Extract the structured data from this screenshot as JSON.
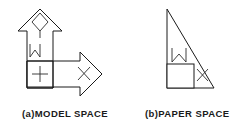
{
  "image": {
    "width": 241,
    "height": 128,
    "background_color": "#ffffff",
    "line_color": "#1a1a1a",
    "kind": "line-art-diagram"
  },
  "figures": [
    {
      "id": "model-space",
      "caption": "(a)MODEL SPACE",
      "description": "Composite arrow outline: an arrow pointing up joined with an arrow pointing right, sharing a square corner region.",
      "glyphs": [
        {
          "name": "diamond",
          "symbol": "diamond",
          "location": "inside up-arrow head"
        },
        {
          "name": "zigzag",
          "symbol": "W",
          "location": "inside up-arrow shaft"
        },
        {
          "name": "plus",
          "symbol": "+",
          "location": "lower-left square cell"
        },
        {
          "name": "cross",
          "symbol": "x",
          "location": "inside right-arrow head"
        }
      ]
    },
    {
      "id": "paper-space",
      "caption": "(b)PAPER SPACE",
      "description": "Right triangle with vertical left leg and horizontal bottom leg, hypotenuse from top-left to bottom-right.",
      "glyphs": [
        {
          "name": "zigzag",
          "symbol": "W",
          "location": "above the square"
        },
        {
          "name": "square",
          "symbol": "square",
          "location": "bottom-left inside triangle"
        },
        {
          "name": "cross",
          "symbol": "x",
          "location": "right of the square"
        }
      ]
    }
  ],
  "captions": {
    "left": "(a)MODEL SPACE",
    "right": "(b)PAPER SPACE"
  }
}
